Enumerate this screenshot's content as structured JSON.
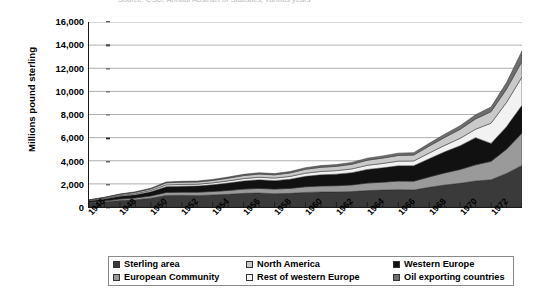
{
  "source_caption": "Source: CSO, Annual Abstract of Statistics, various years",
  "axis": {
    "y_title": "Millions pound sterling",
    "y_ticks": [
      "0",
      "2,000",
      "4,000",
      "6,000",
      "8,000",
      "10,000",
      "12,000",
      "14,000",
      "16,000"
    ],
    "x_ticks": [
      "1946",
      "1948",
      "1950",
      "1952",
      "1954",
      "1956",
      "1958",
      "1960",
      "1962",
      "1964",
      "1966",
      "1968",
      "1970",
      "1972"
    ]
  },
  "legend": {
    "items": [
      {
        "label": "Sterling area",
        "color": "#3a3a3a",
        "swatch": "legend-swatch-sterling-area"
      },
      {
        "label": "North America",
        "color": "#c9c9c9",
        "swatch": "legend-swatch-north-america"
      },
      {
        "label": "Western Europe",
        "color": "#111111",
        "swatch": "legend-swatch-western-europe"
      },
      {
        "label": "European Community",
        "color": "#9a9a9a",
        "swatch": "legend-swatch-european-community"
      },
      {
        "label": "Rest of western Europe",
        "color": "#f2f2f2",
        "swatch": "legend-swatch-rest-of-western-europe"
      },
      {
        "label": "Oil exporting countries",
        "color": "#6e6e6e",
        "swatch": "legend-swatch-oil-exporting-countries"
      }
    ]
  },
  "chart_data": {
    "type": "area",
    "stacked": true,
    "title": "",
    "xlabel": "",
    "ylabel": "Millions pound sterling",
    "ylim": [
      0,
      16000
    ],
    "ytick_step": 2000,
    "grid": true,
    "legend_position": "bottom",
    "x": [
      1946,
      1947,
      1948,
      1949,
      1950,
      1951,
      1952,
      1953,
      1954,
      1955,
      1956,
      1957,
      1958,
      1959,
      1960,
      1961,
      1962,
      1963,
      1964,
      1965,
      1966,
      1967,
      1968,
      1969,
      1970,
      1971,
      1972,
      1973,
      1974
    ],
    "series": [
      {
        "name": "Sterling area",
        "color": "#3a3a3a",
        "values": [
          330,
          430,
          560,
          620,
          760,
          1000,
          1010,
          1000,
          1040,
          1100,
          1180,
          1210,
          1150,
          1180,
          1260,
          1300,
          1300,
          1330,
          1420,
          1460,
          1500,
          1470,
          1700,
          1900,
          2050,
          2250,
          2350,
          2900,
          3600
        ]
      },
      {
        "name": "European Community",
        "color": "#9a9a9a",
        "values": [
          60,
          90,
          130,
          160,
          200,
          260,
          270,
          280,
          300,
          330,
          370,
          400,
          400,
          430,
          490,
          520,
          540,
          580,
          650,
          690,
          740,
          760,
          900,
          1050,
          1200,
          1400,
          1600,
          2100,
          2800
        ]
      },
      {
        "name": "Western Europe",
        "color": "#111111",
        "values": [
          120,
          170,
          230,
          280,
          360,
          500,
          520,
          530,
          580,
          640,
          700,
          740,
          730,
          790,
          900,
          960,
          1000,
          1060,
          1180,
          1240,
          1320,
          1340,
          1580,
          1820,
          2050,
          2350,
          1550,
          1950,
          2400
        ]
      },
      {
        "name": "Rest of western Europe",
        "color": "#f2f2f2",
        "values": [
          40,
          55,
          75,
          90,
          110,
          150,
          155,
          160,
          170,
          190,
          210,
          225,
          225,
          245,
          275,
          295,
          305,
          325,
          360,
          380,
          405,
          415,
          490,
          560,
          640,
          730,
          1750,
          2100,
          2450
        ]
      },
      {
        "name": "North America",
        "color": "#c9c9c9",
        "values": [
          50,
          70,
          95,
          115,
          140,
          185,
          190,
          195,
          210,
          235,
          260,
          275,
          275,
          300,
          340,
          360,
          375,
          400,
          440,
          465,
          495,
          510,
          600,
          690,
          780,
          890,
          1000,
          1150,
          1350
        ]
      },
      {
        "name": "Oil exporting countries",
        "color": "#6e6e6e",
        "values": [
          20,
          28,
          38,
          46,
          56,
          74,
          76,
          78,
          84,
          94,
          104,
          110,
          110,
          120,
          136,
          144,
          150,
          160,
          176,
          186,
          198,
          204,
          240,
          276,
          312,
          356,
          400,
          560,
          900
        ]
      }
    ]
  }
}
